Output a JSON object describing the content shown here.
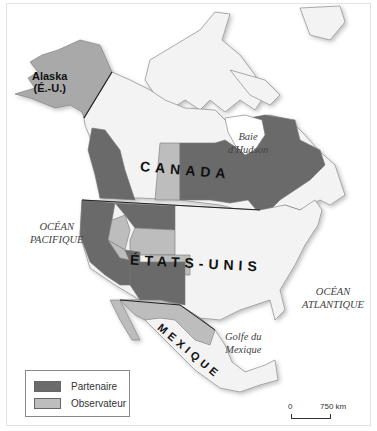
{
  "map": {
    "labels": {
      "canada": "CANADA",
      "usa": "ÉTATS-UNIS",
      "mexico": "MEXIQUE",
      "alaska_line1": "Alaska",
      "alaska_line2": "(É.-U.)",
      "hudson_line1": "Baie",
      "hudson_line2": "d'Hudson",
      "pacific_line1": "OCÉAN",
      "pacific_line2": "PACIFIQUE",
      "atlantic_line1": "OCÉAN",
      "atlantic_line2": "ATLANTIQUE",
      "gulf_line1": "Golfe du",
      "gulf_line2": "Mexique"
    },
    "colors": {
      "partner": "#6b6b6b",
      "observer": "#bdbdbd",
      "land": "#f3f3f3",
      "alaska": "#a9a9a9",
      "water": "#ffffff"
    }
  },
  "legend": {
    "items": [
      {
        "label": "Partenaire",
        "color": "#6b6b6b"
      },
      {
        "label": "Observateur",
        "color": "#bdbdbd"
      }
    ]
  },
  "scale": {
    "start": "0",
    "end": "750 km"
  }
}
